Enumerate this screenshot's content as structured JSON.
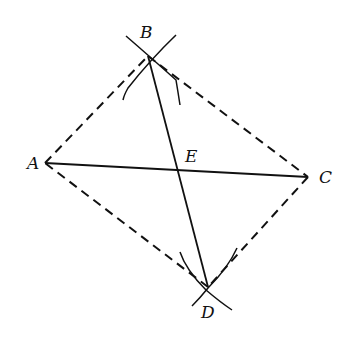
{
  "diagram": {
    "type": "geometric-construction",
    "points": {
      "A": {
        "label": "A",
        "x": 45,
        "y": 163
      },
      "B": {
        "label": "B",
        "x": 148,
        "y": 56
      },
      "C": {
        "label": "C",
        "x": 308,
        "y": 177
      },
      "D": {
        "label": "D",
        "x": 208,
        "y": 287
      },
      "E": {
        "label": "E",
        "x": 180,
        "y": 170
      }
    },
    "solid_segments": [
      "AC",
      "BD"
    ],
    "dashed_segments": [
      "AB",
      "BC",
      "CD",
      "DA"
    ],
    "construction_arcs": [
      "arc-cross-at-B",
      "arc-cross-at-D"
    ],
    "colors": {
      "stroke": "#111111",
      "background": "#ffffff"
    }
  }
}
